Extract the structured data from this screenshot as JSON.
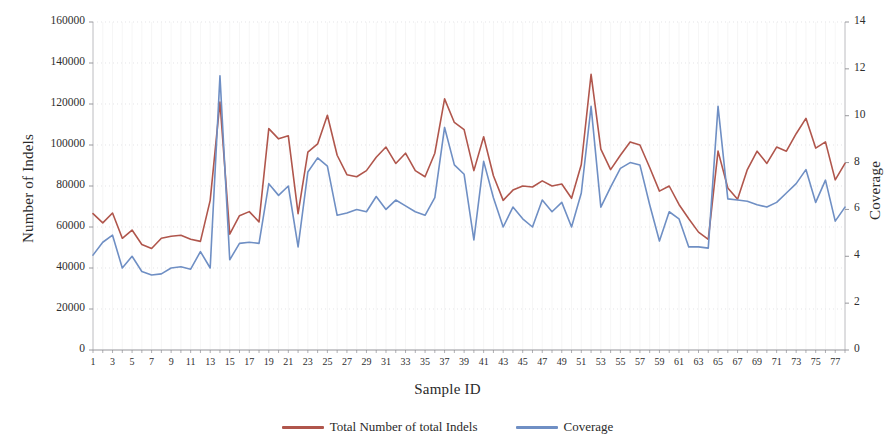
{
  "chart_data": {
    "type": "line",
    "title": "",
    "xlabel": "Sample ID",
    "ylabel": "Number of Indels",
    "y2label": "Coverage",
    "grid": true,
    "legend_position": "bottom",
    "xlim": [
      1,
      78
    ],
    "ylim": [
      0,
      160000
    ],
    "y2lim": [
      0,
      14
    ],
    "y_ticks": [
      0,
      20000,
      40000,
      60000,
      80000,
      100000,
      120000,
      140000,
      160000
    ],
    "y_tick_labels": [
      "0",
      "20000",
      "40000",
      "60000",
      "80000",
      "100000",
      "120000",
      "140000",
      "160000"
    ],
    "y2_ticks": [
      0,
      2,
      4,
      6,
      8,
      10,
      12,
      14
    ],
    "y2_tick_labels": [
      "0",
      "2",
      "4",
      "6",
      "8",
      "10",
      "12",
      "14"
    ],
    "x": [
      1,
      2,
      3,
      4,
      5,
      6,
      7,
      8,
      9,
      10,
      11,
      12,
      13,
      14,
      15,
      16,
      17,
      18,
      19,
      20,
      21,
      22,
      23,
      24,
      25,
      26,
      27,
      28,
      29,
      30,
      31,
      32,
      33,
      34,
      35,
      36,
      37,
      38,
      39,
      40,
      41,
      42,
      43,
      44,
      45,
      46,
      47,
      48,
      49,
      50,
      51,
      52,
      53,
      54,
      55,
      56,
      57,
      58,
      59,
      60,
      61,
      62,
      63,
      64,
      65,
      66,
      67,
      68,
      69,
      70,
      71,
      72,
      73,
      74,
      75,
      76,
      77,
      78
    ],
    "x_tick_labels": [
      "1",
      "3",
      "5",
      "7",
      "9",
      "11",
      "13",
      "15",
      "17",
      "19",
      "21",
      "23",
      "25",
      "27",
      "29",
      "31",
      "33",
      "35",
      "37",
      "39",
      "41",
      "43",
      "45",
      "47",
      "49",
      "51",
      "53",
      "55",
      "57",
      "59",
      "61",
      "63",
      "65",
      "67",
      "69",
      "71",
      "73",
      "75",
      "77"
    ],
    "series": [
      {
        "name": "Total Number of total Indels",
        "axis": "left",
        "color": "#b0564c",
        "values": [
          66500,
          62000,
          66800,
          54500,
          58500,
          51500,
          49500,
          54500,
          55500,
          56000,
          54000,
          53000,
          73000,
          121000,
          56500,
          65500,
          67500,
          62500,
          108000,
          103000,
          104500,
          66500,
          96500,
          100500,
          114500,
          95000,
          85500,
          84500,
          87500,
          94000,
          99000,
          91000,
          96000,
          87500,
          84500,
          96000,
          122500,
          111000,
          107500,
          87500,
          104000,
          85000,
          73000,
          78000,
          80000,
          79500,
          82500,
          80000,
          81000,
          74000,
          90500,
          134500,
          98000,
          88000,
          95000,
          101500,
          100000,
          89000,
          77500,
          80000,
          71000,
          64000,
          57500,
          54000,
          97000,
          79000,
          73500,
          88000,
          97000,
          91000,
          99000,
          97000,
          105500,
          113000,
          98500,
          101500,
          83000,
          91000
        ]
      },
      {
        "name": "Coverage",
        "axis": "right",
        "color": "#6f8fc4",
        "values": [
          4.05,
          4.6,
          4.9,
          3.5,
          4.0,
          3.35,
          3.2,
          3.25,
          3.5,
          3.55,
          3.45,
          4.2,
          3.5,
          11.7,
          3.85,
          4.55,
          4.6,
          4.55,
          7.1,
          6.6,
          7.0,
          4.4,
          7.6,
          8.2,
          7.85,
          5.75,
          5.85,
          6.0,
          5.9,
          6.55,
          6.0,
          6.4,
          6.15,
          5.9,
          5.75,
          6.5,
          9.5,
          7.9,
          7.5,
          4.7,
          8.05,
          6.5,
          5.25,
          6.1,
          5.6,
          5.25,
          6.4,
          5.9,
          6.3,
          5.25,
          6.7,
          10.4,
          6.1,
          6.95,
          7.75,
          8.0,
          7.9,
          6.2,
          4.65,
          5.9,
          5.6,
          4.4,
          4.4,
          4.35,
          10.4,
          6.45,
          6.4,
          6.35,
          6.2,
          6.1,
          6.3,
          6.7,
          7.1,
          7.7,
          6.3,
          7.25,
          5.5,
          6.1
        ]
      }
    ]
  },
  "legend": {
    "items": [
      {
        "label": "Total Number of total Indels",
        "color": "#b0564c"
      },
      {
        "label": "Coverage",
        "color": "#6f8fc4"
      }
    ]
  }
}
